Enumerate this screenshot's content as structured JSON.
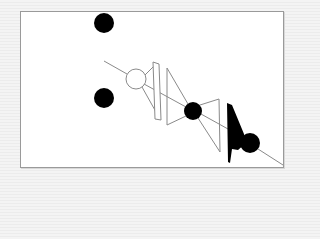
{
  "diagram": {
    "frame": {
      "x": 20,
      "y": 11,
      "width": 262,
      "height": 155,
      "border_color": "#9a9a9a",
      "fill": "#ffffff"
    },
    "colors": {
      "stroke": "#8a8a8a",
      "fill_dark": "#000000",
      "fill_light": "#ffffff"
    },
    "filled_circles": [
      {
        "name": "dot-top-left",
        "cx": 104,
        "cy": 23,
        "r": 10
      },
      {
        "name": "dot-mid-left",
        "cx": 104,
        "cy": 98,
        "r": 10
      },
      {
        "name": "dot-center",
        "cx": 193,
        "cy": 111,
        "r": 9
      },
      {
        "name": "dot-lower-right",
        "cx": 250,
        "cy": 143,
        "r": 10
      }
    ],
    "hollow_circles": [
      {
        "name": "ring-center-left",
        "cx": 136,
        "cy": 79,
        "r": 10
      }
    ],
    "lines": [
      {
        "x1": 104,
        "y1": 61,
        "x2": 127,
        "y2": 74
      },
      {
        "x1": 145,
        "y1": 75,
        "x2": 154,
        "y2": 66
      },
      {
        "x1": 142,
        "y1": 87,
        "x2": 156,
        "y2": 112
      },
      {
        "x1": 144,
        "y1": 84,
        "x2": 186,
        "y2": 107
      },
      {
        "x1": 167,
        "y1": 68,
        "x2": 188,
        "y2": 104
      },
      {
        "x1": 167,
        "y1": 68,
        "x2": 167,
        "y2": 125
      },
      {
        "x1": 167,
        "y1": 125,
        "x2": 186,
        "y2": 116
      },
      {
        "x1": 200,
        "y1": 105,
        "x2": 219,
        "y2": 99
      },
      {
        "x1": 219,
        "y1": 99,
        "x2": 220,
        "y2": 152
      },
      {
        "x1": 198,
        "y1": 118,
        "x2": 220,
        "y2": 152
      },
      {
        "x1": 201,
        "y1": 114,
        "x2": 228,
        "y2": 129
      },
      {
        "x1": 258,
        "y1": 149,
        "x2": 283,
        "y2": 165
      }
    ],
    "outlined_polygons": [
      {
        "name": "slanted-bar",
        "points": "153,62 159,64 161,120 155,119"
      }
    ],
    "filled_polygons": [
      {
        "name": "black-wedge",
        "points": "227,103 232,105 244,134 246,143 238,150 232,149 230,163 228,162"
      }
    ]
  }
}
